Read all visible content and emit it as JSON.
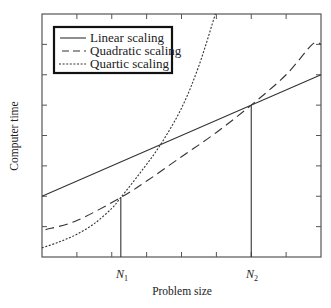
{
  "chart_data": {
    "type": "line",
    "title": "",
    "xlabel": "Problem size",
    "ylabel": "Computer time",
    "xlim": [
      0,
      8
    ],
    "ylim": [
      0,
      8
    ],
    "grid": false,
    "x_ticks": [
      1,
      2,
      3,
      4,
      5,
      6,
      7
    ],
    "y_ticks": [
      1,
      2,
      3,
      4,
      5,
      6,
      7
    ],
    "tick_labels_shown": false,
    "legend_position": "upper left",
    "series": [
      {
        "name": "Linear scaling",
        "style": "solid",
        "x": [
          0,
          8
        ],
        "y": [
          2.0,
          6.0
        ]
      },
      {
        "name": "Quadratic scaling",
        "style": "dashed",
        "x": [
          0.1,
          1.0,
          2.26,
          3.0,
          4.0,
          5.0,
          6.0,
          7.0,
          7.75,
          8.0
        ],
        "y": [
          0.9,
          1.2,
          1.96,
          2.5,
          3.3,
          4.1,
          5.0,
          6.0,
          7.0,
          7.0
        ]
      },
      {
        "name": "Quartic scaling",
        "style": "dotted",
        "x": [
          0,
          0.5,
          1.0,
          1.5,
          2.0,
          2.26,
          2.8,
          3.37,
          4.0,
          4.5,
          4.97
        ],
        "y": [
          0.3,
          0.5,
          0.75,
          1.1,
          1.6,
          1.96,
          2.75,
          3.65,
          4.9,
          6.3,
          8.0
        ]
      }
    ],
    "annotations": [
      {
        "label": "N1",
        "x": 2.26,
        "y": 1.96,
        "type": "vertical-line",
        "note": "quadratic and quartic curves intersect"
      },
      {
        "label": "N2",
        "x": 6.0,
        "y": 5.0,
        "type": "vertical-line",
        "note": "linear and quadratic curves intersect"
      }
    ]
  },
  "labels": {
    "xlabel": "Problem size",
    "ylabel": "Computer time",
    "n1_main": "N",
    "n1_sub": "1",
    "n2_main": "N",
    "n2_sub": "2"
  },
  "legend": {
    "items": [
      {
        "label": "Linear scaling",
        "style": "solid"
      },
      {
        "label": "Quadratic scaling",
        "style": "dashed"
      },
      {
        "label": "Quartic scaling",
        "style": "dotted"
      }
    ]
  }
}
